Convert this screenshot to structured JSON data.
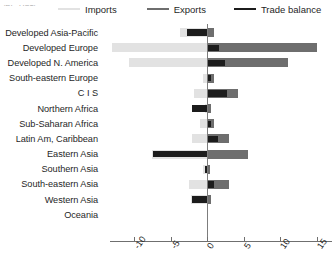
{
  "caption": "(Bln US$)",
  "legend": {
    "position": "top",
    "items": [
      {
        "label": "Imports",
        "color": "#e2e2e2",
        "name": "imports"
      },
      {
        "label": "Exports",
        "color": "#6e6e6e",
        "name": "exports"
      },
      {
        "label": "Trade balance",
        "color": "#1c1c1c",
        "name": "trade-balance"
      }
    ]
  },
  "chart_data": {
    "type": "bar",
    "orientation": "horizontal",
    "title": "",
    "xlabel": "",
    "ylabel": "",
    "xlim": [
      -13.3,
      17.1
    ],
    "xticks": [
      -10,
      -5,
      0,
      5,
      10,
      15
    ],
    "xticklabels": [
      "-10",
      "-5",
      "0",
      "5",
      "10",
      "15"
    ],
    "grid": false,
    "categories": [
      "Developed Asia-Pacific",
      "Developed Europe",
      "Developed N. America",
      "South-eastern Europe",
      "C I S",
      "Northern Africa",
      "Sub-Saharan Africa",
      "Latin Am, Caribbean",
      "Eastern Asia",
      "Southern Asia",
      "South-eastern Asia",
      "Western Asia",
      "Oceania",
      ""
    ],
    "series": [
      {
        "name": "Imports",
        "color": "#e2e2e2",
        "values": [
          -3.7,
          -13.0,
          -10.7,
          -0.6,
          -1.8,
          -0.3,
          -0.9,
          -2.1,
          -7.5,
          -0.5,
          -2.5,
          -2.2,
          0,
          0
        ]
      },
      {
        "name": "Exports",
        "color": "#6e6e6e",
        "values": [
          1.0,
          15.0,
          11.1,
          0.9,
          4.3,
          0.6,
          0.9,
          3.0,
          5.6,
          0.4,
          3.0,
          0.5,
          0,
          0
        ]
      },
      {
        "name": "Trade balance",
        "color": "#1c1c1c",
        "values": [
          -2.7,
          1.7,
          2.5,
          0.6,
          2.7,
          -2.0,
          0.5,
          1.5,
          -7.4,
          -0.3,
          1.0,
          -2.0,
          0,
          0
        ]
      }
    ]
  }
}
